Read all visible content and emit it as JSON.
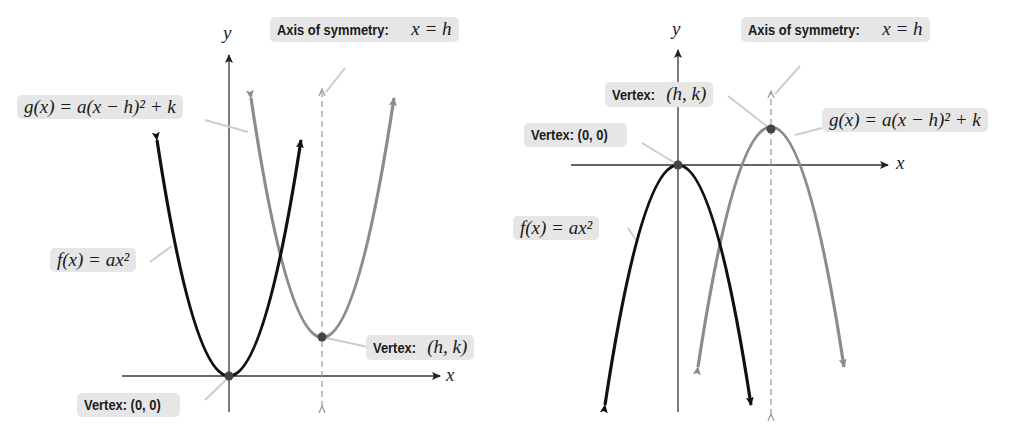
{
  "panels": [
    {
      "id": "left",
      "orientation": "opens-up",
      "axis_labels": {
        "x": "x",
        "y": "y"
      },
      "labels": {
        "axis_of_symmetry_prefix": "Axis of symmetry:",
        "axis_of_symmetry_eq": "x = h",
        "g": "g(x) = a(x − h)² + k",
        "f": "f(x) = ax²",
        "vertex_hk_prefix": "Vertex:",
        "vertex_hk": "(h, k)",
        "vertex_00": "Vertex: (0, 0)"
      }
    },
    {
      "id": "right",
      "orientation": "opens-down",
      "axis_labels": {
        "x": "x",
        "y": "y"
      },
      "labels": {
        "axis_of_symmetry_prefix": "Axis of symmetry:",
        "axis_of_symmetry_eq": "x = h",
        "g": "g(x) = a(x − h)² + k",
        "f": "f(x) = ax²",
        "vertex_hk_prefix": "Vertex:",
        "vertex_hk": "(h, k)",
        "vertex_00": "Vertex: (0, 0)"
      }
    }
  ],
  "colors": {
    "f_curve": "#111111",
    "g_curve": "#8c8c8c",
    "axis": "#333333",
    "label_bg": "#e6e6e6"
  }
}
